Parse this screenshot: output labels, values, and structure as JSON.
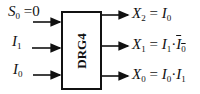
{
  "block": {
    "name": "DRG4"
  },
  "inputs": [
    {
      "var": "S",
      "sub": "0",
      "eq": "=",
      "value": "0"
    },
    {
      "var": "I",
      "sub": "1"
    },
    {
      "var": "I",
      "sub": "0"
    }
  ],
  "outputs": [
    {
      "lhs_var": "X",
      "lhs_sub": "2",
      "eq": "=",
      "terms": [
        {
          "var": "I",
          "sub": "0",
          "bar": false
        }
      ]
    },
    {
      "lhs_var": "X",
      "lhs_sub": "1",
      "eq": "=",
      "dot": "·",
      "terms": [
        {
          "var": "I",
          "sub": "1",
          "bar": false
        },
        {
          "var": "I",
          "sub": "0",
          "bar": true
        }
      ]
    },
    {
      "lhs_var": "X",
      "lhs_sub": "0",
      "eq": "=",
      "dot": "·",
      "terms": [
        {
          "var": "I",
          "sub": "0",
          "bar": false
        },
        {
          "var": "I",
          "sub": "1",
          "bar": false
        }
      ]
    }
  ]
}
